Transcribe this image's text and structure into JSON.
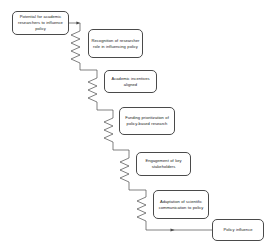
{
  "diagram": {
    "type": "flowchart",
    "orientation": "descending-staircase",
    "canvas": {
      "width": 274,
      "height": 249
    },
    "style": {
      "background_color": "#ffffff",
      "box_border_color": "#4a4a4a",
      "box_fill_color": "#ffffff",
      "connector_color": "#4a4a4a",
      "text_color": "#1a1a1a"
    },
    "nodes": [
      {
        "id": "n1",
        "label": "Potential for academic researchers to influence policy",
        "x": 12,
        "y": 11,
        "w": 57,
        "h": 24
      },
      {
        "id": "n2",
        "label": "Recognition of researcher role in influencing policy",
        "x": 88,
        "y": 29,
        "w": 55,
        "h": 29
      },
      {
        "id": "n3",
        "label": "Academic incentives aligned",
        "x": 104,
        "y": 70,
        "w": 53,
        "h": 23
      },
      {
        "id": "n4",
        "label": "Funding prioritization of policy-based research",
        "x": 119,
        "y": 107,
        "w": 56,
        "h": 28
      },
      {
        "id": "n5",
        "label": "Engagement of key stakeholders",
        "x": 136,
        "y": 152,
        "w": 55,
        "h": 24
      },
      {
        "id": "n6",
        "label": "Adaptation of scientific communication to policy",
        "x": 153,
        "y": 190,
        "w": 56,
        "h": 29
      },
      {
        "id": "n7",
        "label": "Policy influence",
        "x": 212,
        "y": 219,
        "w": 52,
        "h": 22
      }
    ],
    "connectors": [
      {
        "id": "c1",
        "from": "n1",
        "to": "n2",
        "kind": "zigzag-spring",
        "arrowhead": true
      },
      {
        "id": "c2",
        "from": "n2",
        "to": "n3",
        "kind": "zigzag-spring",
        "arrowhead": false
      },
      {
        "id": "c3",
        "from": "n3",
        "to": "n4",
        "kind": "zigzag-spring",
        "arrowhead": false
      },
      {
        "id": "c4",
        "from": "n4",
        "to": "n5",
        "kind": "zigzag-spring",
        "arrowhead": false
      },
      {
        "id": "c5",
        "from": "n5",
        "to": "n6",
        "kind": "zigzag-spring",
        "arrowhead": false
      },
      {
        "id": "c6",
        "from": "n6",
        "to": "n7",
        "kind": "straight-horizontal",
        "arrowhead": true
      }
    ]
  }
}
